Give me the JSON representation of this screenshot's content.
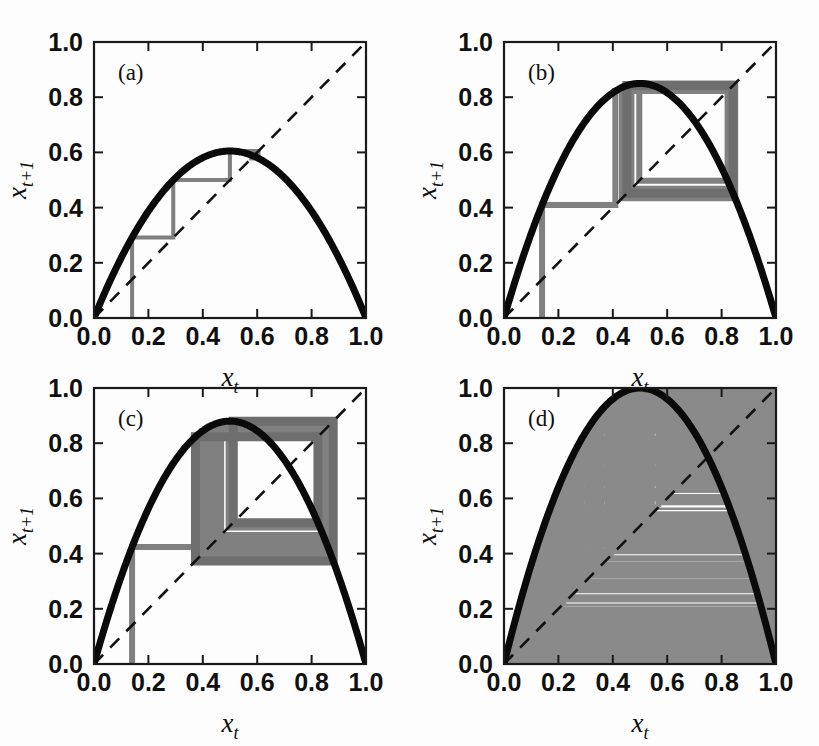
{
  "figure": {
    "width": 819,
    "height": 746,
    "background": "#fdfdfd"
  },
  "style": {
    "curve_color": "#0a0a0a",
    "diagonal_color": "#111111",
    "cobweb_color": "#808080",
    "cobweb_color_dark": "#6e6e6e",
    "axis_color": "#1a1a1a",
    "text_color": "#101010"
  },
  "axes": {
    "x_label_base": "x",
    "x_label_sub": "t",
    "y_label_base": "x",
    "y_label_sub": "t+1",
    "tick_labels": [
      "0.0",
      "0.2",
      "0.4",
      "0.6",
      "0.8",
      "1.0"
    ],
    "tick_values": [
      0.0,
      0.2,
      0.4,
      0.6,
      0.8,
      1.0
    ],
    "xlim": [
      0.0,
      1.0
    ],
    "ylim": [
      0.0,
      1.0
    ]
  },
  "chart_data": {
    "type": "line",
    "title": "",
    "xlabel": "x_t",
    "ylabel": "x_{t+1}",
    "xlim": [
      0.0,
      1.0
    ],
    "ylim": [
      0.0,
      1.0
    ],
    "grid": false,
    "legend": "none",
    "shared": {
      "map_equation": "x_{t+1} = r x_t (1 - x_t)",
      "diagonal": "x_{t+1} = x_t",
      "x0": 0.14,
      "tick_values": [
        0.0,
        0.2,
        0.4,
        0.6,
        0.8,
        1.0
      ]
    },
    "panels": [
      {
        "tag": "(a)",
        "r": 2.42,
        "peak": 0.605,
        "regime": "stable fixed point",
        "fixed_point": 0.587,
        "cobweb_iterations": 9,
        "cobweb_tail_iterations": 0,
        "cobweb_points_x": [
          0.14,
          0.14,
          0.291,
          0.291,
          0.499,
          0.499,
          0.605,
          0.605,
          0.578,
          0.578,
          0.59,
          0.59,
          0.585,
          0.585,
          0.587,
          0.587
        ],
        "cobweb_points_y": [
          0.0,
          0.291,
          0.291,
          0.499,
          0.499,
          0.605,
          0.605,
          0.578,
          0.578,
          0.59,
          0.59,
          0.585,
          0.585,
          0.587,
          0.587,
          0.587
        ],
        "description": "orbit spirals into single fixed point near 0.59"
      },
      {
        "tag": "(b)",
        "r": 3.4,
        "peak": 0.85,
        "regime": "period-2 cycle",
        "cycle_values": [
          0.452,
          0.8422
        ],
        "cobweb_iterations": 40,
        "description": "orbit settles onto a two-point cycle forming a rectangle"
      },
      {
        "tag": "(c)",
        "r": 3.52,
        "peak": 0.88,
        "regime": "period-4 cycle",
        "cycle_values": [
          0.3828,
          0.8315,
          0.4926,
          0.8795
        ],
        "cobweb_iterations": 80,
        "description": "orbit settles onto a four-point cycle, nested rectangles"
      },
      {
        "tag": "(d)",
        "r": 4.0,
        "peak": 1.0,
        "regime": "fully chaotic",
        "cobweb_iterations": 900,
        "description": "orbit wanders over the whole unit interval filling the region"
      }
    ]
  }
}
